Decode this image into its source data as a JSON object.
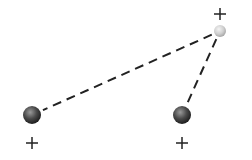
{
  "diagram": {
    "title": "",
    "atoms": [
      {
        "id": "atom-top-right",
        "x": 220,
        "y": 31,
        "r": 6,
        "shade": "light",
        "charge": "+",
        "label_x": 220,
        "label_y": 14
      },
      {
        "id": "atom-bottom-left",
        "x": 32,
        "y": 115,
        "r": 9,
        "shade": "dark",
        "charge": "+",
        "label_x": 32,
        "label_y": 143
      },
      {
        "id": "atom-bottom-right",
        "x": 182,
        "y": 115,
        "r": 9,
        "shade": "dark",
        "charge": "+",
        "label_x": 182,
        "label_y": 143
      }
    ],
    "bonds": [
      {
        "from": "atom-top-right",
        "to": "atom-bottom-left",
        "style": "dashed"
      },
      {
        "from": "atom-top-right",
        "to": "atom-bottom-right",
        "style": "dashed"
      }
    ],
    "colors": {
      "dark_sphere": "#4a4a4a",
      "light_sphere": "#d8d8d8",
      "line": "#222222",
      "label": "#222222"
    }
  }
}
